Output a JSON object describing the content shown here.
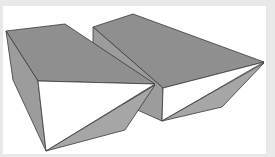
{
  "figure": {
    "solids": [
      {
        "name": "left-wedge",
        "faces": [
          "top",
          "left-side",
          "front",
          "lower-facet"
        ]
      },
      {
        "name": "right-wedge",
        "faces": [
          "top",
          "left-side",
          "front",
          "lower-facet"
        ]
      }
    ],
    "colors": {
      "background": "#ffffff",
      "frame": "#e9e9e9",
      "top_face": "#8f8f8f",
      "side_face": "#9c9c9c",
      "front_face": "#ffffff",
      "lower_face": "#a6a6a6",
      "edge": "#3a3a3a"
    }
  }
}
